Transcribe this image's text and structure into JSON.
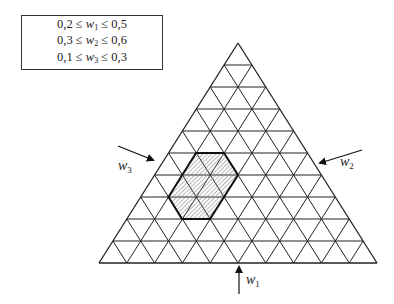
{
  "constraints_box": {
    "lines": [
      {
        "lower": "0,2",
        "rel1": "≤",
        "var": "w",
        "sub": "1",
        "rel2": "≤",
        "upper": "0,5"
      },
      {
        "lower": "0,3",
        "rel1": "≤",
        "var": "w",
        "sub": "2",
        "rel2": "≤",
        "upper": "0,6"
      },
      {
        "lower": "0,1",
        "rel1": "≤",
        "var": "w",
        "sub": "3",
        "rel2": "≤",
        "upper": "0,3"
      }
    ]
  },
  "ternary": {
    "divisions": 10,
    "apex": [
      238,
      43
    ],
    "base_left": [
      99,
      263
    ],
    "base_right": [
      377,
      263
    ],
    "line_color": "#222222",
    "region": {
      "description": "feasible weight region (hatched hexagon)",
      "polygon": [
        [
          196,
          153
        ],
        [
          224,
          153
        ],
        [
          238,
          175
        ],
        [
          224,
          197
        ],
        [
          210,
          219
        ],
        [
          182,
          219
        ],
        [
          168.5,
          197
        ]
      ],
      "hatch_color": "#888888",
      "border_color": "#111111"
    }
  },
  "axes": {
    "w1": {
      "var": "w",
      "sub": "1"
    },
    "w2": {
      "var": "w",
      "sub": "2"
    },
    "w3": {
      "var": "w",
      "sub": "3"
    }
  }
}
